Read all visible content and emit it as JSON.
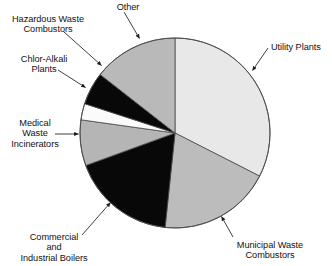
{
  "chart_data": {
    "type": "pie",
    "title": "",
    "subtitle": "",
    "xlabel": "",
    "ylabel": "",
    "legend_position": "none",
    "grid": false,
    "labels_placement": "callout-leader-lines",
    "categories": [
      "Utility Plants",
      "Municipal Waste Combustors",
      "Commercial and Industrial Boilers",
      "Medical Waste Incinerators",
      "Chlor-Alkali Plants",
      "Hazardous Waste Combustors",
      "Other"
    ],
    "values": [
      32.5,
      19.2,
      17.8,
      7.8,
      2.8,
      5.6,
      14.3
    ],
    "units": "percent",
    "start_angle_deg": 0,
    "direction": "clockwise",
    "slices": [
      {
        "label": "Utility Plants",
        "value": 32.5,
        "color": "#e8e8e8",
        "start_deg": 0,
        "end_deg": 117
      },
      {
        "label": "Municipal Waste Combustors",
        "value": 19.2,
        "color": "#bcbcbc",
        "start_deg": 117,
        "end_deg": 186
      },
      {
        "label": "Commercial and Industrial Boilers",
        "value": 17.8,
        "color": "#080808",
        "start_deg": 186,
        "end_deg": 250
      },
      {
        "label": "Medical Waste Incinerators",
        "value": 7.8,
        "color": "#b5b5b5",
        "start_deg": 250,
        "end_deg": 278
      },
      {
        "label": "Chlor-Alkali Plants",
        "value": 2.8,
        "color": "#fbfbfb",
        "start_deg": 278,
        "end_deg": 288
      },
      {
        "label": "Hazardous Waste Combustors",
        "value": 5.6,
        "color": "#080808",
        "start_deg": 288,
        "end_deg": 308
      },
      {
        "label": "Other",
        "value": 14.3,
        "color": "#b9b9b9",
        "start_deg": 308,
        "end_deg": 360
      }
    ]
  },
  "labels": {
    "other": {
      "line1": "Other"
    },
    "hazardous_waste_combustors": {
      "line1": "Hazardous Waste",
      "line2": "Combustors"
    },
    "chlor_alkali_plants": {
      "line1": "Chlor-Alkali",
      "line2": "Plants"
    },
    "medical_waste_incinerators": {
      "line1": "Medical",
      "line2": "Waste",
      "line3": "Incinerators"
    },
    "commercial_industrial_boilers": {
      "line1": "Commercial",
      "line2": "and",
      "line3": "Industrial Boilers"
    },
    "municipal_waste_combustors": {
      "line1": "Municipal Waste",
      "line2": "Combustors"
    },
    "utility_plants": {
      "line1": "Utility Plants"
    }
  },
  "colors": {
    "light_gray": "#e8e8e8",
    "medium_gray": "#bcbcbc",
    "black": "#080808",
    "white": "#fbfbfb",
    "outline": "#4a4a4a",
    "text": "#111111",
    "leader_line": "#2a2a2a"
  }
}
